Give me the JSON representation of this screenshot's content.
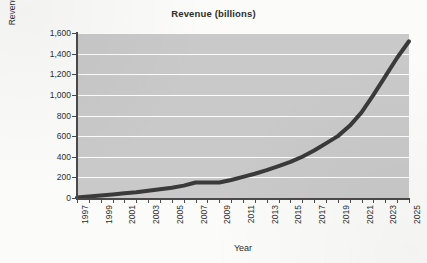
{
  "chart_data": {
    "type": "line",
    "title": "Revenue (billions)",
    "xlabel": "Year",
    "ylabel": "Revenues (Billions USD)",
    "xlim": [
      1997,
      2025
    ],
    "ylim": [
      0,
      1600
    ],
    "ytick_labels": [
      "1,600",
      "1,400",
      "1,200",
      "1,000",
      "800",
      "600",
      "400",
      "200",
      "0"
    ],
    "ytick_values": [
      1600,
      1400,
      1200,
      1000,
      800,
      600,
      400,
      200,
      0
    ],
    "xtick_labels": [
      "1997",
      "1999",
      "2001",
      "2003",
      "2005",
      "2007",
      "2009",
      "2011",
      "2013",
      "2015",
      "2017",
      "2019",
      "2021",
      "2023",
      "2025"
    ],
    "xtick_values": [
      1997,
      1999,
      2001,
      2003,
      2005,
      2007,
      2009,
      2011,
      2013,
      2015,
      2017,
      2019,
      2021,
      2023,
      2025
    ],
    "grid": "horizontal",
    "legend": "none",
    "plot_background": "#c9c9c9",
    "gridline_color": "#fdfdfd",
    "line_color": "#3a3a3a",
    "line_width": 4,
    "x": [
      1997,
      1998,
      1999,
      2000,
      2001,
      2002,
      2003,
      2004,
      2005,
      2006,
      2007,
      2008,
      2009,
      2010,
      2011,
      2012,
      2013,
      2014,
      2015,
      2016,
      2017,
      2018,
      2019,
      2020,
      2021,
      2022,
      2023,
      2024,
      2025
    ],
    "values": [
      5,
      15,
      25,
      35,
      45,
      55,
      70,
      85,
      100,
      120,
      150,
      150,
      150,
      175,
      205,
      235,
      270,
      310,
      350,
      400,
      460,
      530,
      600,
      700,
      830,
      1000,
      1180,
      1360,
      1520
    ],
    "series": [
      {
        "name": "Revenue",
        "values": [
          5,
          15,
          25,
          35,
          45,
          55,
          70,
          85,
          100,
          120,
          150,
          150,
          150,
          175,
          205,
          235,
          270,
          310,
          350,
          400,
          460,
          530,
          600,
          700,
          830,
          1000,
          1180,
          1360,
          1520
        ]
      }
    ]
  }
}
